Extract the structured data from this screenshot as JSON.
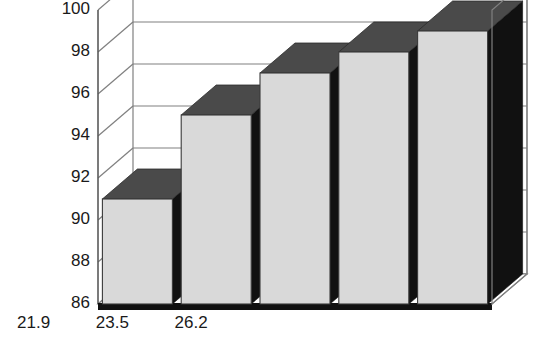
{
  "chart_data": {
    "type": "bar",
    "title": "",
    "subtitle": "",
    "xlabel": "Age (years)",
    "ylabel": "%Total body bone mineral content",
    "ylabel_line1": "%Total body bone",
    "ylabel_line2": "mineral content",
    "categories": [
      "17.4",
      "19.8",
      "21.9",
      "23.5",
      "26.2"
    ],
    "values": [
      91,
      95,
      97,
      98,
      99
    ],
    "data_labels": [
      "91%",
      "95%",
      "97%",
      "98%",
      "99%"
    ],
    "ylim": [
      86,
      100
    ],
    "yticks": [
      86,
      88,
      90,
      92,
      94,
      96,
      98,
      100
    ],
    "ytick_labels": [
      "86",
      "88",
      "90",
      "92",
      "94",
      "96",
      "98",
      "100"
    ],
    "grid": true,
    "legend": false,
    "three_d": true,
    "colors": {
      "bar_front": "#d9d9d9",
      "bar_top": "#4a4a4a",
      "bar_side": "#111111",
      "grid": "#808080",
      "axis": "#000000",
      "text": "#1a1a1a",
      "background": "#ffffff"
    }
  }
}
